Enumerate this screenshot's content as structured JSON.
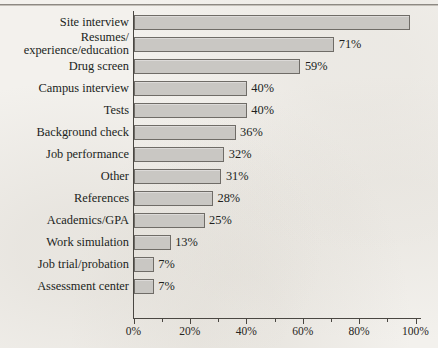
{
  "figure": {
    "caption_fragment": "",
    "top_rule": true,
    "paper_color": "#f3f1ed",
    "bar_fill": "#c9c7c3",
    "bar_border": "#6f6c67",
    "axis_color": "#4a4742",
    "text_color": "#211f1c"
  },
  "chart_data": {
    "type": "bar",
    "orientation": "horizontal",
    "title": "",
    "xlabel": "",
    "ylabel": "",
    "xlim": [
      0,
      100
    ],
    "grid": false,
    "legend": null,
    "value_suffix": "%",
    "categories": [
      "Site interview",
      "Resumes/\nexperience/education",
      "Drug screen",
      "Campus interview",
      "Tests",
      "Background check",
      "Job performance",
      "Other",
      "References",
      "Academics/GPA",
      "Work simulation",
      "Job trial/probation",
      "Assessment center"
    ],
    "values": [
      98,
      71,
      59,
      40,
      40,
      36,
      32,
      31,
      28,
      25,
      13,
      7,
      7
    ],
    "data_labels": [
      "",
      "71%",
      "59%",
      "40%",
      "40%",
      "36%",
      "32%",
      "31%",
      "28%",
      "25%",
      "13%",
      "7%",
      "7%"
    ],
    "bars": [
      {
        "label_line1": "Site interview",
        "label_line2": "",
        "value": 98,
        "data_label": ""
      },
      {
        "label_line1": "Resumes/",
        "label_line2": "experience/education",
        "value": 71,
        "data_label": "71%"
      },
      {
        "label_line1": "Drug screen",
        "label_line2": "",
        "value": 59,
        "data_label": "59%"
      },
      {
        "label_line1": "Campus interview",
        "label_line2": "",
        "value": 40,
        "data_label": "40%"
      },
      {
        "label_line1": "Tests",
        "label_line2": "",
        "value": 40,
        "data_label": "40%"
      },
      {
        "label_line1": "Background check",
        "label_line2": "",
        "value": 36,
        "data_label": "36%"
      },
      {
        "label_line1": "Job performance",
        "label_line2": "",
        "value": 32,
        "data_label": "32%"
      },
      {
        "label_line1": "Other",
        "label_line2": "",
        "value": 31,
        "data_label": "31%"
      },
      {
        "label_line1": "References",
        "label_line2": "",
        "value": 28,
        "data_label": "28%"
      },
      {
        "label_line1": "Academics/GPA",
        "label_line2": "",
        "value": 25,
        "data_label": "25%"
      },
      {
        "label_line1": "Work simulation",
        "label_line2": "",
        "value": 13,
        "data_label": "13%"
      },
      {
        "label_line1": "Job trial/probation",
        "label_line2": "",
        "value": 7,
        "data_label": "7%"
      },
      {
        "label_line1": "Assessment center",
        "label_line2": "",
        "value": 7,
        "data_label": "7%"
      }
    ],
    "x_axis": {
      "major_ticks": [
        0,
        20,
        40,
        60,
        80,
        100
      ],
      "major_tick_labels": [
        "0%",
        "20%",
        "40%",
        "60%",
        "80%",
        "100%"
      ],
      "minor_ticks": [
        10,
        30,
        50,
        70,
        90
      ]
    }
  }
}
